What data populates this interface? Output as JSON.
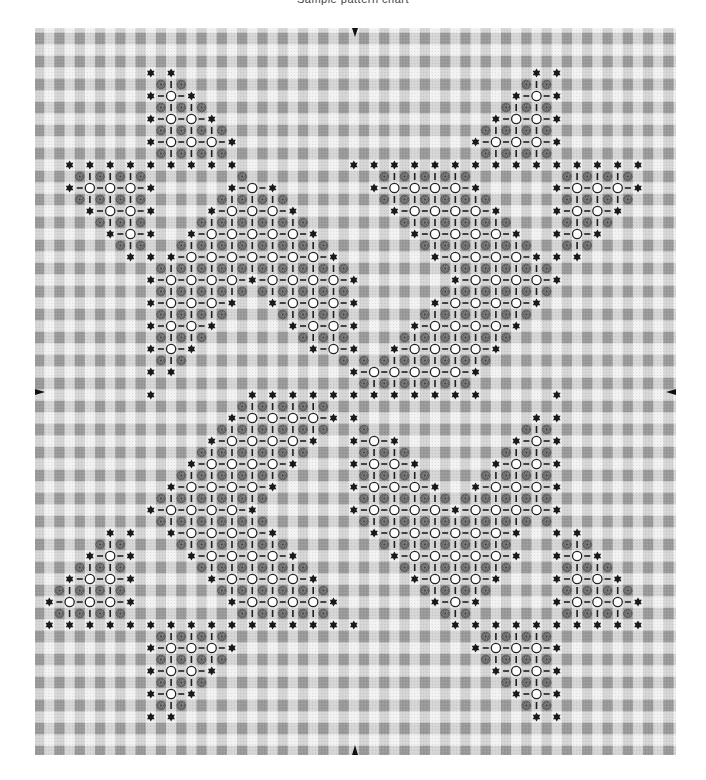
{
  "header": {
    "caption": "Sample pattern chart"
  },
  "colors": {
    "background": "#ffffff",
    "gingham_light": "#f2f2f2",
    "gingham_mid": "#bdbdbd",
    "gingham_dark": "#8a8a8a",
    "hex_fill": "#1a1a1a",
    "circle_stroke": "#222222",
    "circle_fill": "#ffffff",
    "rosette_fill": "#7d7d7d",
    "rosette_stroke": "#3a3a3a",
    "dash": "#1e1e1e",
    "marker": "#111111"
  },
  "chart_data": {
    "type": "table",
    "title": "",
    "legend": {
      "H": "black six-point star (hexagon) stitch",
      "O": "open circle stitch",
      "R": "grey rosette stitch (auto-placed in filled cells)",
      "-": "straight connecting stitch"
    },
    "grid": {
      "columns": 33,
      "rows": 33
    },
    "center_markers": [
      "top",
      "bottom",
      "left",
      "right"
    ],
    "rows": [
      {
        "m": 2,
        "H": [
          6,
          7,
          25,
          26
        ],
        "O": []
      },
      {
        "m": 3,
        "H": [
          6,
          8,
          24,
          26
        ],
        "O": [
          7,
          25
        ]
      },
      {
        "m": 4,
        "H": [
          6,
          9,
          23,
          26
        ],
        "O": [
          7,
          8,
          24,
          25
        ]
      },
      {
        "m": 5,
        "H": [
          6,
          10,
          22,
          26
        ],
        "O": [
          7,
          8,
          9,
          23,
          24,
          25
        ]
      },
      {
        "m": 6,
        "H": [
          2,
          3,
          4,
          5,
          6,
          7,
          8,
          9,
          10,
          16,
          17,
          18,
          19,
          20,
          21,
          22,
          23,
          24,
          25,
          26,
          27,
          28,
          29,
          30
        ],
        "O": []
      },
      {
        "m": 7,
        "H": [
          2,
          6,
          10,
          12,
          17,
          22,
          26,
          30
        ],
        "O": [
          3,
          4,
          5,
          11,
          18,
          19,
          20,
          21,
          27,
          28,
          29
        ]
      },
      {
        "m": 8,
        "H": [
          3,
          6,
          9,
          13,
          18,
          23,
          26,
          29
        ],
        "O": [
          4,
          5,
          10,
          11,
          12,
          19,
          20,
          21,
          22,
          27,
          28
        ]
      },
      {
        "m": 9,
        "H": [
          4,
          6,
          8,
          14,
          19,
          24,
          26,
          28
        ],
        "O": [
          5,
          9,
          10,
          11,
          12,
          13,
          20,
          21,
          22,
          23,
          27
        ]
      },
      {
        "m": 10,
        "H": [
          5,
          6,
          7,
          15,
          20,
          25,
          26,
          27
        ],
        "O": [
          8,
          9,
          10,
          11,
          12,
          13,
          14,
          21,
          22,
          23,
          24
        ]
      },
      {
        "m": 11,
        "H": [
          6,
          11,
          16,
          21,
          26
        ],
        "O": [
          7,
          8,
          9,
          10,
          12,
          13,
          14,
          15,
          22,
          23,
          24,
          25
        ]
      },
      {
        "m": 12,
        "H": [
          6,
          10,
          12,
          16,
          20,
          25
        ],
        "O": [
          7,
          8,
          9,
          13,
          14,
          15,
          21,
          22,
          23,
          24
        ]
      },
      {
        "m": 13,
        "H": [
          6,
          9,
          13,
          16,
          19,
          24
        ],
        "O": [
          7,
          8,
          14,
          15,
          20,
          21,
          22,
          23
        ]
      },
      {
        "m": 14,
        "H": [
          6,
          8,
          14,
          16,
          18,
          23
        ],
        "O": [
          7,
          15,
          19,
          20,
          21,
          22
        ]
      },
      {
        "m": 15,
        "H": [
          6,
          7,
          16,
          22
        ],
        "O": [
          17,
          18,
          19,
          20,
          21
        ]
      },
      {
        "m": 16,
        "H": [
          6,
          11,
          12,
          13,
          14,
          15,
          16,
          17,
          18,
          19,
          20,
          21,
          22,
          26
        ],
        "O": []
      },
      {
        "m": 17,
        "H": [
          10,
          15,
          16,
          25,
          26
        ],
        "O": [
          11,
          12,
          13,
          14
        ]
      },
      {
        "m": 18,
        "H": [
          9,
          14,
          16,
          18,
          24,
          26
        ],
        "O": [
          10,
          11,
          12,
          13,
          17,
          25
        ]
      },
      {
        "m": 19,
        "H": [
          8,
          13,
          16,
          19,
          23,
          26
        ],
        "O": [
          9,
          10,
          11,
          12,
          17,
          18,
          24,
          25
        ]
      },
      {
        "m": 20,
        "H": [
          7,
          12,
          16,
          20,
          22,
          26
        ],
        "O": [
          8,
          9,
          10,
          11,
          17,
          18,
          19,
          23,
          24,
          25
        ]
      },
      {
        "m": 21,
        "H": [
          6,
          11,
          16,
          21,
          26
        ],
        "O": [
          7,
          8,
          9,
          10,
          17,
          18,
          19,
          20,
          22,
          23,
          24,
          25
        ]
      },
      {
        "m": 22,
        "H": [
          4,
          5,
          7,
          12,
          17,
          24,
          26,
          27
        ],
        "O": [
          8,
          9,
          10,
          11,
          18,
          19,
          20,
          21,
          22,
          23
        ]
      },
      {
        "m": 23,
        "H": [
          3,
          5,
          8,
          13,
          18,
          24,
          26,
          28
        ],
        "O": [
          4,
          9,
          10,
          11,
          12,
          19,
          20,
          21,
          22,
          23,
          27
        ]
      },
      {
        "m": 24,
        "H": [
          2,
          5,
          9,
          14,
          19,
          23,
          26,
          29
        ],
        "O": [
          3,
          4,
          10,
          11,
          12,
          13,
          20,
          21,
          22,
          27,
          28
        ]
      },
      {
        "m": 25,
        "H": [
          1,
          5,
          10,
          15,
          20,
          22,
          26,
          30
        ],
        "O": [
          2,
          3,
          4,
          11,
          12,
          13,
          14,
          21,
          27,
          28,
          29
        ]
      },
      {
        "m": 26,
        "H": [
          1,
          2,
          3,
          4,
          5,
          6,
          7,
          8,
          9,
          10,
          11,
          12,
          13,
          14,
          15,
          16,
          21,
          22,
          23,
          24,
          25,
          26,
          27,
          28,
          29,
          30
        ],
        "O": []
      },
      {
        "m": 27,
        "H": [
          6,
          10,
          22,
          26
        ],
        "O": [
          7,
          8,
          9,
          23,
          24,
          25
        ]
      },
      {
        "m": 28,
        "H": [
          6,
          9,
          23,
          26
        ],
        "O": [
          7,
          8,
          24,
          25
        ]
      },
      {
        "m": 29,
        "H": [
          6,
          8,
          24,
          26
        ],
        "O": [
          7,
          25
        ]
      },
      {
        "m": 30,
        "H": [
          6,
          7,
          25,
          26
        ],
        "O": []
      }
    ]
  }
}
